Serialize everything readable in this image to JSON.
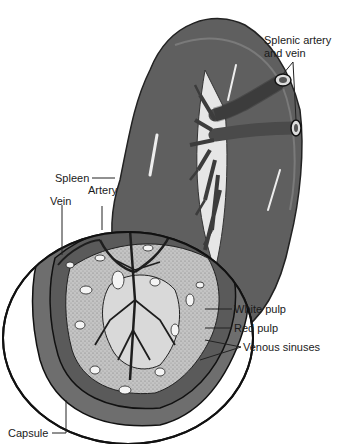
{
  "diagram": {
    "labels": {
      "splenic_vessels_line1": "Splenic artery",
      "splenic_vessels_line2": "and vein",
      "spleen": "Spleen",
      "artery": "Artery",
      "vein": "Vein",
      "white_pulp": "White pulp",
      "red_pulp": "Red pulp",
      "venous_sinuses": "Venous sinuses",
      "capsule": "Capsule"
    },
    "colors": {
      "organ_fill": "#5f5f5f",
      "organ_dark": "#3c3c3c",
      "capsule_ring": "#6e6e6e",
      "white_pulp": "#d9d9d9",
      "stipple": "#bdbdbd",
      "sinus": "#f2f2f2",
      "outline": "#111111",
      "background": "#ffffff"
    }
  }
}
